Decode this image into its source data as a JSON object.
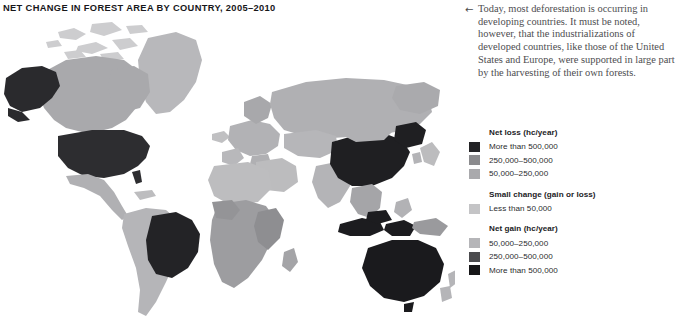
{
  "title": "NET CHANGE IN FOREST AREA BY COUNTRY, 2005–2010",
  "caption": {
    "arrow_icon": "←",
    "text": "Today, most deforestation is occurring in developing countries. It must be noted, however, that the industrializations of developed countries, like those of the United States and Europe, were supported in large part by the harvesting of their own forests."
  },
  "legend": {
    "groups": [
      {
        "title": "Net loss (hc/year)",
        "items": [
          {
            "label": "More than 500,000",
            "color": "#232326"
          },
          {
            "label": "250,000–500,000",
            "color": "#8b8b8e"
          },
          {
            "label": "50,000–250,000",
            "color": "#a9a9ac"
          }
        ]
      },
      {
        "title": "Small change (gain or loss)",
        "items": [
          {
            "label": "Less than 50,000",
            "color": "#c4c4c6"
          }
        ]
      },
      {
        "title": "Net gain (hc/year)",
        "items": [
          {
            "label": "50,000–250,000",
            "color": "#b5b5b8"
          },
          {
            "label": "250,000–500,000",
            "color": "#4b4b4e"
          },
          {
            "label": "More than 500,000",
            "color": "#161618"
          }
        ]
      }
    ]
  },
  "map": {
    "name": "world-choropleth-forest-change",
    "background": "#ffffff",
    "palette": {
      "loss_high": "#232326",
      "loss_mid": "#8b8b8e",
      "loss_low": "#a9a9ac",
      "small_change": "#c4c4c6",
      "gain_low": "#b5b5b8",
      "gain_mid": "#4b4b4e",
      "gain_high": "#161618"
    },
    "regions": [
      {
        "name": "alaska",
        "shade": "#2a2a2d"
      },
      {
        "name": "canada",
        "shade": "#a9a9ac"
      },
      {
        "name": "greenland",
        "shade": "#b8b8bb"
      },
      {
        "name": "united-states",
        "shade": "#2d2d30"
      },
      {
        "name": "mexico-central-america",
        "shade": "#b0b0b3"
      },
      {
        "name": "brazil",
        "shade": "#232326"
      },
      {
        "name": "south-america-other",
        "shade": "#b5b5b8"
      },
      {
        "name": "europe",
        "shade": "#b2b2b5"
      },
      {
        "name": "russia",
        "shade": "#b0b0b3"
      },
      {
        "name": "north-africa-middle-east",
        "shade": "#bcbcbe"
      },
      {
        "name": "sub-saharan-africa",
        "shade": "#9d9da0"
      },
      {
        "name": "india-south-asia",
        "shade": "#b4b4b7"
      },
      {
        "name": "china",
        "shade": "#1f1f22"
      },
      {
        "name": "southeast-asia",
        "shade": "#a5a5a8"
      },
      {
        "name": "indonesia",
        "shade": "#1c1c1f"
      },
      {
        "name": "australia",
        "shade": "#1a1a1d"
      },
      {
        "name": "new-zealand",
        "shade": "#b5b5b8"
      }
    ]
  }
}
